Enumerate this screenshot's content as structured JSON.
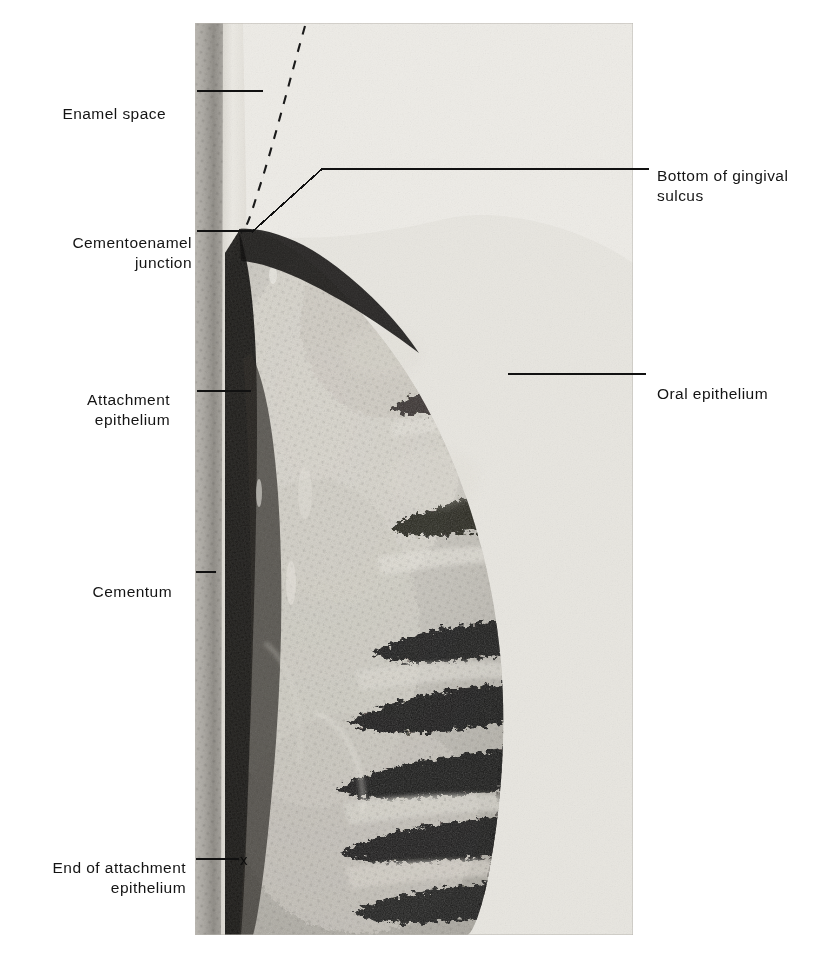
{
  "figure": {
    "kind": "histology-photomicrograph",
    "plate": {
      "x": 195,
      "y": 23,
      "width": 438,
      "height": 912,
      "background_color": "#cfcfcb",
      "ink_dark": "#141414",
      "ink_mid": "#6e6b66",
      "ink_light": "#e7e5df"
    }
  },
  "labels": {
    "left": [
      {
        "id": "enamel-space",
        "text": "Enamel space",
        "text_x": 166,
        "text_y": 84,
        "leader": {
          "x1": 197,
          "y1": 91,
          "x2": 263,
          "y2": 91,
          "type": "straight"
        }
      },
      {
        "id": "cementoenamel-junction",
        "text": "Cementoenamel\njunction",
        "text_x": 192,
        "text_y": 213,
        "leader": {
          "x1": 197,
          "y1": 231,
          "x2": 252,
          "y2": 231,
          "type": "straight"
        }
      },
      {
        "id": "attachment-epithelium",
        "text": "Attachment\nepithelium",
        "text_x": 170,
        "text_y": 370,
        "leader": {
          "x1": 197,
          "y1": 391,
          "x2": 251,
          "y2": 391,
          "type": "straight"
        }
      },
      {
        "id": "cementum",
        "text": "Cementum",
        "text_x": 172,
        "text_y": 565,
        "leader": {
          "x1": 196,
          "y1": 572,
          "x2": 216,
          "y2": 572,
          "type": "straight"
        }
      },
      {
        "id": "end-of-attachment-epithelium",
        "text": "End of attachment\nepithelium",
        "text_x": 186,
        "text_y": 838,
        "leader": {
          "x1": 196,
          "y1": 859,
          "x2": 239,
          "y2": 859,
          "type": "straight"
        }
      }
    ],
    "right": [
      {
        "id": "bottom-of-gingival-sulcus",
        "text": "Bottom of gingival\nsulcus",
        "text_x": 657,
        "text_y": 146,
        "leader": {
          "type": "polyline",
          "points": "252,232 322,169 649,169"
        }
      },
      {
        "id": "oral-epithelium",
        "text": "Oral epithelium",
        "text_x": 657,
        "text_y": 364,
        "leader": {
          "x1": 508,
          "y1": 374,
          "x2": 646,
          "y2": 374,
          "type": "straight"
        }
      }
    ]
  },
  "annotations": {
    "dashed_enamel_outline": {
      "id": "enamel-outline-dashed",
      "description": "Dashed curve tracing the missing enamel contour down to the cementoenamel junction",
      "path": "M 110 3 C 96 52, 76 128, 58 182 C 50 204, 48 210, 46 210",
      "dash": "9 9"
    },
    "x_marker": {
      "id": "end-of-attachment-x",
      "text": "x",
      "x": 243,
      "y": 859
    }
  },
  "colors": {
    "ink": "#141414",
    "paper": "#ffffff",
    "plate_base": "#cfcfcb",
    "enamel_space_light": "#eceae4",
    "dentin_grey": "#8e8b85",
    "epithelium_dark": "#1b1a18",
    "connective_light": "#d6d3cb"
  }
}
